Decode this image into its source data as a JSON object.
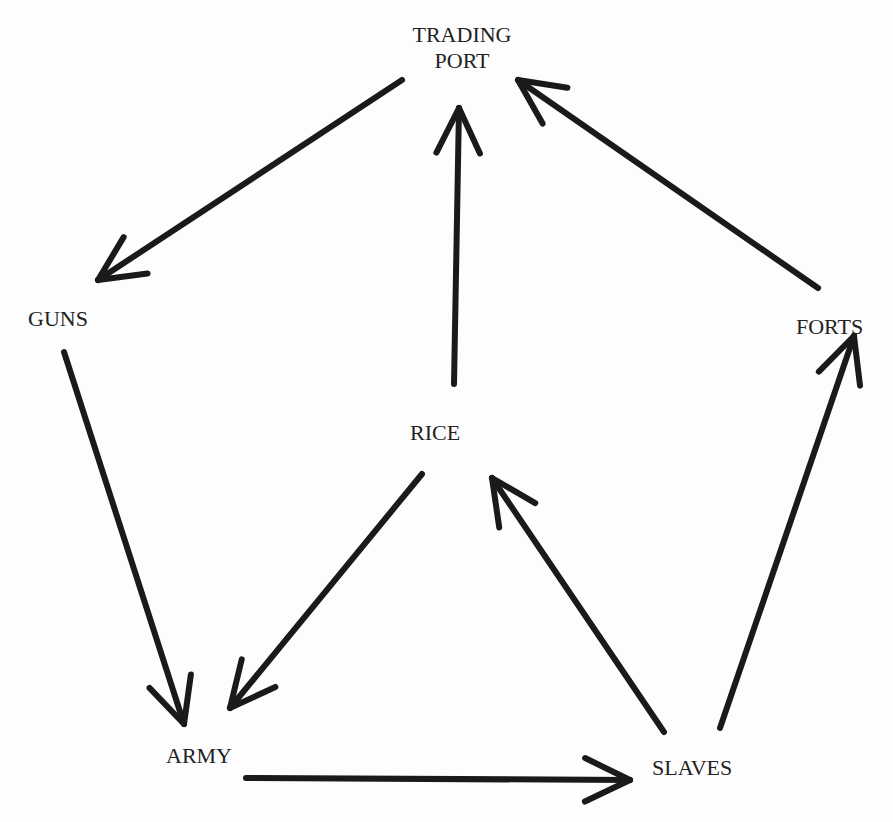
{
  "nodes": {
    "trading_port": {
      "line1": "TRADING",
      "line2": "PORT",
      "x": 462,
      "y": 22
    },
    "guns": {
      "label": "GUNS",
      "x": 64,
      "y": 318
    },
    "forts": {
      "label": "FORTS",
      "x": 835,
      "y": 326
    },
    "rice": {
      "label": "RICE",
      "x": 434,
      "y": 432
    },
    "army": {
      "label": "ARMY",
      "x": 204,
      "y": 755
    },
    "slaves": {
      "label": "SLAVES",
      "x": 698,
      "y": 767
    }
  },
  "edges": [
    {
      "from": "TRADING PORT",
      "to": "GUNS",
      "x1": 402,
      "y1": 80,
      "x2": 98,
      "y2": 280
    },
    {
      "from": "RICE",
      "to": "TRADING PORT",
      "x1": 454,
      "y1": 384,
      "x2": 459,
      "y2": 108
    },
    {
      "from": "FORTS",
      "to": "TRADING PORT",
      "x1": 818,
      "y1": 288,
      "x2": 518,
      "y2": 80
    },
    {
      "from": "GUNS",
      "to": "ARMY",
      "x1": 64,
      "y1": 352,
      "x2": 184,
      "y2": 724
    },
    {
      "from": "RICE",
      "to": "ARMY",
      "x1": 422,
      "y1": 474,
      "x2": 230,
      "y2": 708
    },
    {
      "from": "ARMY",
      "to": "SLAVES",
      "x1": 246,
      "y1": 778,
      "x2": 630,
      "y2": 780
    },
    {
      "from": "SLAVES",
      "to": "RICE",
      "x1": 664,
      "y1": 732,
      "x2": 492,
      "y2": 478
    },
    {
      "from": "SLAVES",
      "to": "FORTS",
      "x1": 720,
      "y1": 728,
      "x2": 854,
      "y2": 336
    }
  ],
  "colors": {
    "line": "#1a1a1a",
    "text": "#222222",
    "background": "#fdfdfd"
  }
}
